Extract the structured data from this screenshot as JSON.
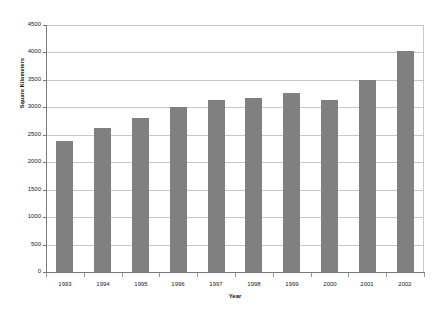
{
  "chart_data": {
    "type": "bar",
    "title": "",
    "subtitle": "",
    "xlabel": "Year",
    "ylabel": "Square Kilometers",
    "categories": [
      "1993",
      "1994",
      "1995",
      "1996",
      "1997",
      "1998",
      "1999",
      "2000",
      "2001",
      "2002"
    ],
    "values": [
      2390,
      2620,
      2800,
      3010,
      3140,
      3170,
      3260,
      3130,
      3500,
      4030
    ],
    "series": [
      {
        "name": "Square Kilometers",
        "values": [
          2390,
          2620,
          2800,
          3010,
          3140,
          3170,
          3260,
          3130,
          3500,
          4030
        ]
      }
    ],
    "ylim": [
      0,
      4500
    ],
    "ytick_labels": [
      "0",
      "500",
      "1000",
      "1500",
      "2000",
      "2500",
      "3000",
      "3500",
      "4000",
      "4500"
    ],
    "ytick_values": [
      0,
      500,
      1000,
      1500,
      2000,
      2500,
      3000,
      3500,
      4000,
      4500
    ],
    "grid": true,
    "grid_axis": "y",
    "legend": false,
    "legend_position": "none",
    "bar_color": "#808080",
    "grid_color": "#c8c8c8",
    "axis_color": "#7a7a7a",
    "background_color": "#ffffff",
    "annotations": []
  }
}
